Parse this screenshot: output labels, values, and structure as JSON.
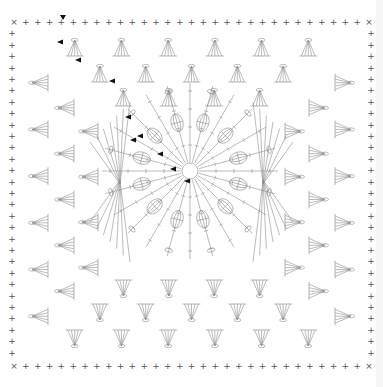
{
  "diagram": {
    "title": "",
    "type": "crochet-granny-square-chart",
    "colors": {
      "stitch": "#8f8f8f",
      "marker": "#111111",
      "background": "#ffffff",
      "edge_strip": "#f6f6f6"
    },
    "bounds": {
      "left": 14,
      "top": 22,
      "right": 369,
      "bottom": 364
    },
    "symbols": {
      "single_crochet": "+",
      "corner_slip": "×",
      "chain": "oval",
      "double_crochet": "T-with-bar",
      "puff": "oval-cluster",
      "start_marker": "black-triangle"
    },
    "border": {
      "stitch": "+",
      "count_per_side": 30,
      "corner_mark": "×"
    },
    "side_fan_rows": 3,
    "fans_per_side_row": [
      6,
      5,
      4
    ],
    "center": {
      "cx": 190,
      "cy": 171,
      "ring_radius": 8,
      "spokes": 24,
      "puff_clusters": 12,
      "puff_radius": 50,
      "outer_radius": 88
    },
    "corner_fans": {
      "count": 4,
      "rays": 7
    },
    "start_markers": [
      {
        "x": 63,
        "y": 18,
        "dir": "down"
      },
      {
        "x": 60,
        "y": 42,
        "dir": "left"
      },
      {
        "x": 78,
        "y": 60,
        "dir": "left"
      },
      {
        "x": 112,
        "y": 81,
        "dir": "left"
      },
      {
        "x": 128,
        "y": 117,
        "dir": "left"
      },
      {
        "x": 133,
        "y": 140,
        "dir": "left"
      },
      {
        "x": 140,
        "y": 136,
        "dir": "left"
      },
      {
        "x": 160,
        "y": 154,
        "dir": "left"
      },
      {
        "x": 173,
        "y": 169,
        "dir": "left"
      },
      {
        "x": 187,
        "y": 181,
        "dir": "left"
      }
    ]
  }
}
